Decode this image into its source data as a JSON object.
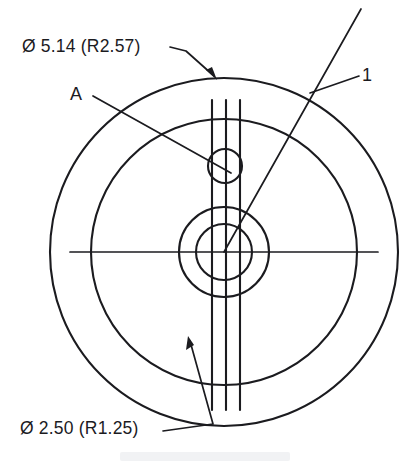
{
  "drawing": {
    "title": "Bearing Race Cross-Section Plan View",
    "background_color": "#ffffff",
    "line_color": "#1b1b1f",
    "canvas": {
      "width": 414,
      "height": 470
    },
    "center": {
      "x": 224,
      "y": 252
    }
  },
  "labels": {
    "outer_diameter": "Ø 5.14 (R2.57)",
    "inner_diameter": "Ø 2.50 (R1.25)",
    "detail_a": "A",
    "item_number": "1"
  },
  "chart_data": {
    "type": "diagram",
    "circles": [
      {
        "name": "outer-circle",
        "cx": 224,
        "cy": 252,
        "r": 174,
        "label": "Ø 5.14 (R2.57)"
      },
      {
        "name": "second-circle",
        "cx": 224,
        "cy": 252,
        "r": 133,
        "label": "Ø 2.50 (R1.25)"
      },
      {
        "name": "third-circle",
        "cx": 224,
        "cy": 252,
        "r": 45,
        "label": ""
      },
      {
        "name": "inner-circle",
        "cx": 224,
        "cy": 252,
        "r": 28,
        "label": ""
      },
      {
        "name": "detail-a-hole",
        "cx": 225,
        "cy": 166,
        "r": 17,
        "label": "A"
      }
    ],
    "vertical_lines": [
      {
        "x": 212,
        "y1": 100,
        "y2": 410
      },
      {
        "x": 226,
        "y1": 100,
        "y2": 410
      },
      {
        "x": 240,
        "y1": 100,
        "y2": 410
      }
    ],
    "center_line": {
      "x1": 70,
      "y1": 252,
      "x2": 378,
      "y2": 252
    },
    "leaders": [
      {
        "name": "outer-diameter-leader",
        "from": [
          185,
          52
        ],
        "to": [
          216,
          78
        ],
        "arrow": true
      },
      {
        "name": "inner-diameter-leader",
        "from": [
          212,
          424
        ],
        "to": [
          190,
          340
        ],
        "arrow": true
      },
      {
        "name": "detail-a-leader",
        "from": [
          92,
          96
        ],
        "to": [
          229,
          172
        ],
        "arrow": false
      },
      {
        "name": "item-1-leader",
        "from": [
          358,
          76
        ],
        "to": [
          312,
          92
        ],
        "arrow": false
      },
      {
        "name": "section-line",
        "from": [
          360,
          10
        ],
        "to": [
          224,
          252
        ],
        "arrow": false
      }
    ],
    "units": "inches"
  }
}
